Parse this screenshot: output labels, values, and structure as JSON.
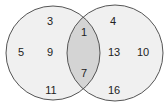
{
  "diagram": {
    "type": "venn",
    "colors": {
      "background": "#ffffff",
      "set_fill": "#f0f0f0",
      "intersection_fill": "#d4d4d4",
      "stroke": "#555555",
      "text": "#222222"
    },
    "sets": [
      {
        "name": "left-set",
        "cx": 53,
        "cy": 53,
        "r": 47
      },
      {
        "name": "right-set",
        "cx": 115,
        "cy": 53,
        "r": 48
      }
    ],
    "regions": {
      "left_only": [
        {
          "label": "3",
          "x": 50,
          "y": 25
        },
        {
          "label": "5",
          "x": 21,
          "y": 56
        },
        {
          "label": "9",
          "x": 50,
          "y": 56
        },
        {
          "label": "11",
          "x": 51,
          "y": 94
        }
      ],
      "intersection": [
        {
          "label": "1",
          "x": 84,
          "y": 36
        },
        {
          "label": "7",
          "x": 84,
          "y": 77
        }
      ],
      "right_only": [
        {
          "label": "4",
          "x": 113,
          "y": 25
        },
        {
          "label": "13",
          "x": 114,
          "y": 56
        },
        {
          "label": "10",
          "x": 143,
          "y": 56
        },
        {
          "label": "16",
          "x": 114,
          "y": 94
        }
      ]
    }
  }
}
